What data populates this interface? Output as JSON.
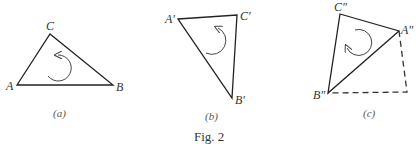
{
  "figure": {
    "caption": "Fig. 2",
    "panels": [
      {
        "id": "a",
        "label": "(a)",
        "vertices": {
          "A": "A",
          "B": "B",
          "C": "C"
        },
        "rotation": "counterclockwise"
      },
      {
        "id": "b",
        "label": "(b)",
        "vertices": {
          "A": "A′",
          "B": "B′",
          "C": "C′"
        },
        "rotation": "counterclockwise"
      },
      {
        "id": "c",
        "label": "(c)",
        "vertices": {
          "A": "A″",
          "B": "B″",
          "C": "C″"
        },
        "rotation": "clockwise",
        "dashed_extension": true
      }
    ]
  }
}
